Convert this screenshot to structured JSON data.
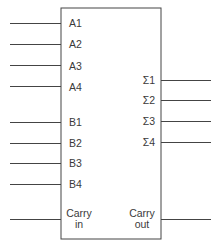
{
  "diagram": {
    "block": {
      "x": 61,
      "y": 8,
      "w": 100,
      "h": 231
    },
    "inputs": [
      {
        "label": "A1",
        "y": 23
      },
      {
        "label": "A2",
        "y": 44
      },
      {
        "label": "A3",
        "y": 65
      },
      {
        "label": "A4",
        "y": 86
      },
      {
        "label": "B1",
        "y": 122
      },
      {
        "label": "B2",
        "y": 143
      },
      {
        "label": "B3",
        "y": 163
      },
      {
        "label": "B4",
        "y": 184
      }
    ],
    "carry_in": {
      "line1": "Carry",
      "line2": "in",
      "y": 219
    },
    "outputs": [
      {
        "label": "Σ1",
        "y": 80
      },
      {
        "label": "Σ2",
        "y": 100
      },
      {
        "label": "Σ3",
        "y": 121
      },
      {
        "label": "Σ4",
        "y": 142
      }
    ],
    "carry_out": {
      "line1": "Carry",
      "line2": "out",
      "y": 219
    }
  }
}
